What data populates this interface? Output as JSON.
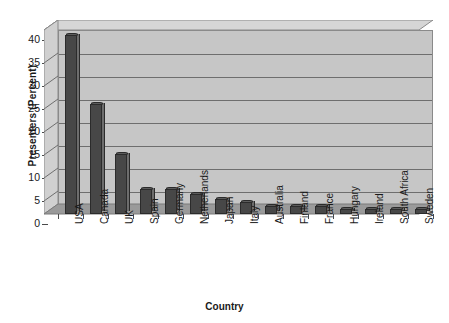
{
  "chart_data": {
    "type": "bar",
    "title": "",
    "xlabel": "Country",
    "ylabel": "Presenters (Percent)",
    "ylim": [
      0,
      40
    ],
    "yticks": [
      0,
      5,
      10,
      15,
      20,
      25,
      30,
      35,
      40
    ],
    "grid": true,
    "legend": "none",
    "style": "3d-column",
    "categories": [
      "USA",
      "Canada",
      "UK",
      "Spain",
      "Germany",
      "Netherlands",
      "Japan",
      "Italy",
      "Australia",
      "Finland",
      "France",
      "Hungary",
      "Ireland",
      "South Africa",
      "Sweden"
    ],
    "values": [
      39,
      24,
      13,
      5.5,
      5.4,
      4.3,
      3.3,
      2.6,
      1.8,
      1.7,
      1.7,
      1.0,
      1.0,
      1.0,
      1.0
    ],
    "series": [
      {
        "name": "Presenters",
        "values": [
          39,
          24,
          13,
          5.5,
          5.4,
          4.3,
          3.3,
          2.6,
          1.8,
          1.7,
          1.7,
          1.0,
          1.0,
          1.0,
          1.0
        ]
      }
    ]
  },
  "colors": {
    "bar_front": "#474747",
    "bar_side": "#6d6d6d",
    "bar_top": "#5c5c5c",
    "plot_background": "#c6c6c6",
    "plot_top_face": "#d6d6d6",
    "plot_floor": "#9a9a9a",
    "gridline": "#6e6e6e",
    "axis": "#4a4a4a",
    "text": "#1a1a1a",
    "page_background": "#ffffff"
  }
}
